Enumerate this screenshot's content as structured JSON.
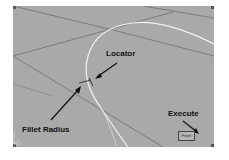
{
  "viewport": {
    "background": "#a9a9a9",
    "grid_color": "#6e6e6e",
    "curve_color": "#f2f2f2"
  },
  "annotations": {
    "locator": "Locator",
    "fillet_radius": "Fillet Radius",
    "execute": "Execute"
  },
  "execute_button": {
    "label": "Finish"
  },
  "locator_marker": {
    "label": "R"
  }
}
